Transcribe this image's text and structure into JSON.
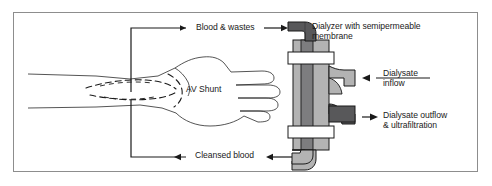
{
  "figure": {
    "border_color": "#8d8d8d",
    "background": "#ffffff"
  },
  "palette": {
    "blood_dark": "#58585a",
    "dialysate_light": "#b3b3b3",
    "mid_gray": "#9a9a9a",
    "line": "#1a1a1a",
    "white": "#ffffff"
  },
  "labels": {
    "blood_wastes": "Blood & wastes",
    "dialyzer": "Dialyzer with semipermeable\nmembrane",
    "dialysate_inflow": "Dialysate\ninflow",
    "dialysate_outflow": "Dialysate outflow\n& ultrafiltration",
    "av_shunt": "AV Shunt",
    "cleansed_blood": "Cleansed blood"
  },
  "arrows": [
    {
      "name": "blood-wastes-from-arm",
      "direction": "right",
      "target": "label"
    },
    {
      "name": "blood-wastes-to-dialyzer",
      "direction": "right",
      "target": "dialyzer-inlet"
    },
    {
      "name": "dialysate-inflow",
      "direction": "left",
      "target": "dialyzer-upper-port"
    },
    {
      "name": "dialysate-outflow",
      "direction": "right",
      "target": "label"
    },
    {
      "name": "cleansed-blood-from-dialyzer",
      "direction": "left",
      "target": "label"
    },
    {
      "name": "cleansed-blood-to-arm",
      "direction": "left",
      "target": "arm"
    }
  ],
  "anatomy": {
    "arm": "forearm and hand line drawing",
    "shunt": "dashed arteriovenous shunt loop at wrist"
  },
  "device": {
    "name": "dialyzer",
    "inlet": "top elbow, blood & wastes in",
    "outlet": "bottom elbow, cleansed blood out",
    "upper_port": "dialysate inflow port",
    "lower_port": "dialysate outflow port",
    "collars": 2
  }
}
